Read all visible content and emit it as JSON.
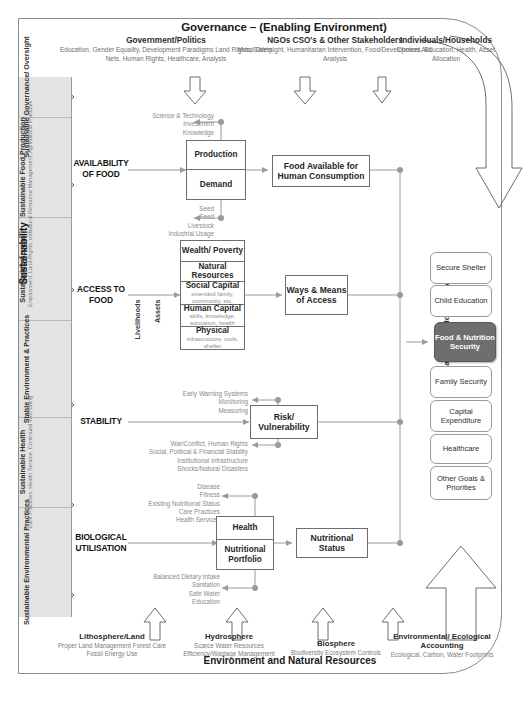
{
  "governance": {
    "title": "Governance – (Enabling Environment)",
    "columns": [
      {
        "heading": "Government/Politics",
        "detail": "Education, Gender Equality, Development Paradigms Land Rights, Safety Nets, Human Rights, Healthcare, Analysis"
      },
      {
        "heading": "NGOs CSO's & Other Stakeholders",
        "detail": "Moral Oversight, Humanitarian Intervention, Food/Development Aid, Analysis"
      },
      {
        "heading": "Individuals/Households",
        "detail": "Choices, Education, Health, Asset Allocation"
      }
    ]
  },
  "sustainability": {
    "axis_label": "Sustainability",
    "bands": [
      {
        "title": "Sustainable Governance/ Oversight",
        "detail": ""
      },
      {
        "title": "Sustainable Food Production",
        "detail": "Natural Resource Management, Agricultural Practices"
      },
      {
        "title": "Sustainable Access",
        "detail": "Employment, Land Rights, etc."
      },
      {
        "title": "Stable Environment & Practices",
        "detail": ""
      },
      {
        "title": "Sustainable Health",
        "detail": "Care Practices, Health Service, Continued Well Being"
      },
      {
        "title": "Sustainable Environmental Practices",
        "detail": ""
      }
    ]
  },
  "stages": [
    {
      "label": "AVAILABILITY OF FOOD"
    },
    {
      "label": "ACCESS TO FOOD"
    },
    {
      "label": "STABILITY"
    },
    {
      "label": "BIOLOGICAL UTILISATION"
    }
  ],
  "availability": {
    "box_top": "Production",
    "box_bottom": "Demand",
    "output": "Food Available for Human Consumption",
    "note_top": "Science & Technology\nInvestment\nKnowledge",
    "note_bottom": "Seed\nFeed\nLivestock\nIndustrial Usage"
  },
  "access": {
    "vcap_left": "Livelihoods",
    "vcap_right": "Assets",
    "rows": [
      {
        "label": "Wealth/ Poverty",
        "sub": ""
      },
      {
        "label": "Natural Resources",
        "sub": ""
      },
      {
        "label": "Social Capital",
        "sub": "extended family, community, etc."
      },
      {
        "label": "Human Capital",
        "sub": "skills, knowledge, education, health"
      },
      {
        "label": "Physical",
        "sub": "infrastructure, tools, shelter"
      }
    ],
    "output": "Ways & Means of Access"
  },
  "stability": {
    "box": "Risk/ Vulnerability",
    "note_top": "Early Warning Systems\nMonitoring\nMeasuring",
    "note_bottom": "War/Conflict, Human Rights\nSocial, Political & Financial Stability\nInstitutional Infrastructure\nShocks/Natural Disasters"
  },
  "biological": {
    "box_top": "Health",
    "box_bottom": "Nutritional Portfolio",
    "output": "Nutritional Status",
    "note_top": "Disease\nFitness\nExisting Nutritional Status\nCare Practices\nHealth Services",
    "note_bottom": "Balanced Dietary Intake\nSanitation\nSafe Water\nEducation"
  },
  "objectives": {
    "axis_label": "Individual/Household Objectives",
    "items": [
      {
        "label": "Secure Shelter",
        "highlight": false
      },
      {
        "label": "Child Education",
        "highlight": false
      },
      {
        "label": "Food & Nutrition Security",
        "highlight": true
      },
      {
        "label": "Family Security",
        "highlight": false
      },
      {
        "label": "Capital Expenditure",
        "highlight": false
      },
      {
        "label": "Healthcare",
        "highlight": false
      },
      {
        "label": "Other Goals & Priorities",
        "highlight": false
      }
    ]
  },
  "environment": {
    "title": "Environment and Natural Resources",
    "columns": [
      {
        "heading": "Lithosphere/Land",
        "detail": "Proper Land Management Forest Care Fossil Energy Use"
      },
      {
        "heading": "Hydrosphere",
        "detail": "Scarce Water Resources Efficiency/Wastage Management"
      },
      {
        "heading": "Biosphere",
        "detail": "Biodiversity Ecosystem Controls"
      },
      {
        "heading": "Environmental/ Ecological Accounting",
        "detail": "Ecological, Carbon, Water Footprints"
      }
    ]
  },
  "colors": {
    "band_grey": "#e3e3e3",
    "highlight_grey": "#6e6e6e",
    "line": "#8c8c8c",
    "muted_text": "#8a8a8a"
  }
}
